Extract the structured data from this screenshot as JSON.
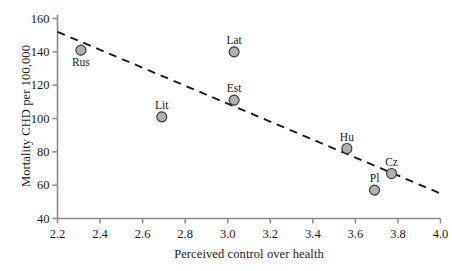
{
  "chart_data": {
    "type": "scatter",
    "title": "",
    "xlabel": "Perceived control over health",
    "ylabel": "Mortality CHD per 100,000",
    "xlim": [
      2.2,
      4.0
    ],
    "ylim": [
      40,
      160
    ],
    "xticks": [
      "2.2",
      "2.4",
      "2.6",
      "2.8",
      "3.0",
      "3.2",
      "3.4",
      "3.6",
      "3.8",
      "4.0"
    ],
    "yticks": [
      "40",
      "60",
      "80",
      "100",
      "120",
      "140",
      "160"
    ],
    "grid": false,
    "legend": "none",
    "marker": {
      "shape": "circle",
      "fill_color": "#b0b0b0",
      "edge_color": "#333333",
      "radius_px": 5
    },
    "points": [
      {
        "label": "Rus",
        "x": 2.31,
        "y": 141,
        "label_position": "below"
      },
      {
        "label": "Lit",
        "x": 2.69,
        "y": 101,
        "label_position": "above"
      },
      {
        "label": "Lat",
        "x": 3.03,
        "y": 140,
        "label_position": "above"
      },
      {
        "label": "Est",
        "x": 3.03,
        "y": 111,
        "label_position": "above"
      },
      {
        "label": "Hu",
        "x": 3.56,
        "y": 82,
        "label_position": "above"
      },
      {
        "label": "Cz",
        "x": 3.77,
        "y": 67,
        "label_position": "above"
      },
      {
        "label": "Pl",
        "x": 3.69,
        "y": 57,
        "label_position": "above"
      }
    ],
    "trendline": {
      "style": "dashed",
      "color": "#1a1a1a",
      "x_start": 2.2,
      "y_start": 152,
      "x_end": 4.0,
      "y_end": 55
    }
  },
  "axes": {
    "axis_color": "#8a8a8a",
    "tick_color": "#8a8a8a"
  }
}
